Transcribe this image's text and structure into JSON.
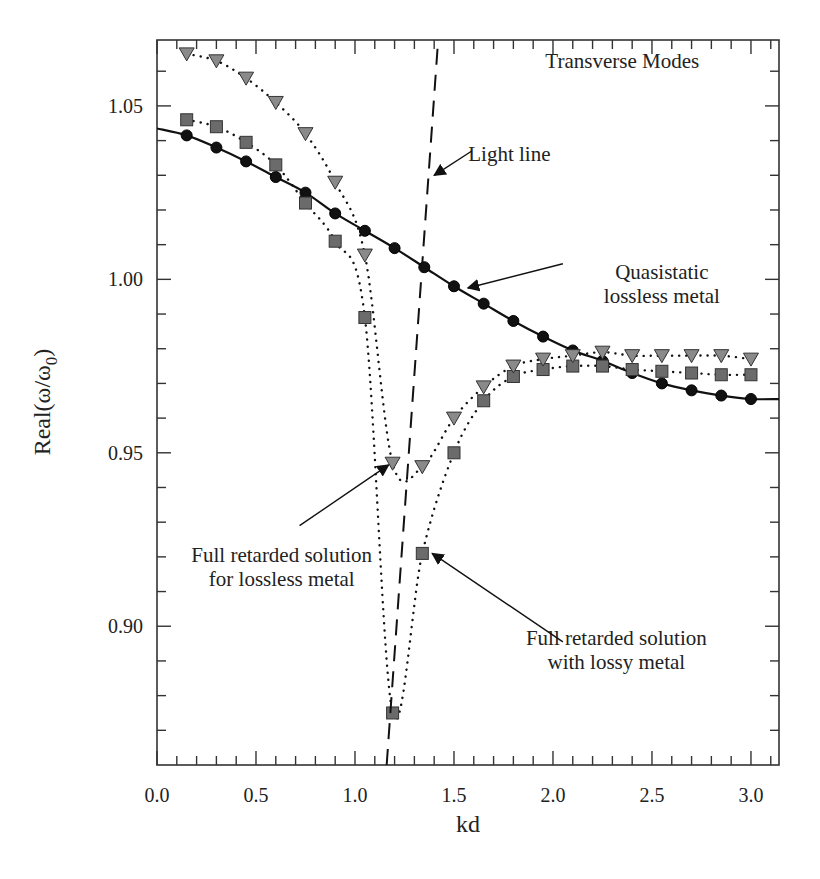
{
  "chart_data": {
    "type": "scatter",
    "title": "",
    "xlabel": "kd",
    "ylabel": "Real(ω/ω₀)",
    "ylabel_main": "Real(ω/ω",
    "ylabel_sub": "0",
    "ylabel_close": ")",
    "xlim": [
      0.0,
      3.1416
    ],
    "ylim": [
      0.86,
      1.069
    ],
    "x_ticks": [
      0.0,
      0.5,
      1.0,
      1.5,
      2.0,
      2.5,
      3.0
    ],
    "x_tick_labels": [
      "0.0",
      "0.5",
      "1.0",
      "1.5",
      "2.0",
      "2.5",
      "3.0"
    ],
    "x_minor_step": 0.1,
    "y_ticks": [
      0.9,
      0.95,
      1.0,
      1.05
    ],
    "y_tick_labels": [
      "0.90",
      "0.95",
      "1.00",
      "1.05"
    ],
    "y_minor_step": 0.01,
    "grid": false,
    "series": [
      {
        "name": "Quasistatic lossless metal",
        "marker": "circle",
        "line": "solid",
        "color": "#111111",
        "x": [
          0.15,
          0.3,
          0.45,
          0.6,
          0.75,
          0.9,
          1.05,
          1.2,
          1.35,
          1.5,
          1.65,
          1.8,
          1.95,
          2.1,
          2.25,
          2.4,
          2.55,
          2.7,
          2.85,
          3.0
        ],
        "y": [
          1.0415,
          1.038,
          1.034,
          1.0295,
          1.025,
          1.019,
          1.014,
          1.009,
          1.0035,
          0.998,
          0.993,
          0.988,
          0.9835,
          0.9795,
          0.9765,
          0.973,
          0.97,
          0.968,
          0.9665,
          0.9655
        ],
        "curve_start": [
          0.0,
          1.0435
        ],
        "curve_end": [
          3.1416,
          0.9655
        ]
      },
      {
        "name": "Full retarded solution with lossy metal",
        "marker": "square",
        "line": "dotted",
        "color": "#6b6b6b",
        "x": [
          0.15,
          0.3,
          0.45,
          0.6,
          0.75,
          0.9,
          1.05,
          1.19,
          1.34,
          1.5,
          1.65,
          1.8,
          1.95,
          2.1,
          2.25,
          2.4,
          2.55,
          2.7,
          2.85,
          3.0
        ],
        "y": [
          1.046,
          1.044,
          1.0395,
          1.033,
          1.022,
          1.011,
          0.989,
          0.875,
          0.921,
          0.95,
          0.965,
          0.972,
          0.974,
          0.975,
          0.975,
          0.974,
          0.9735,
          0.973,
          0.9725,
          0.9725
        ]
      },
      {
        "name": "Full retarded solution for lossless metal",
        "marker": "triangle-down",
        "line": "dotted",
        "color": "#8a8a8a",
        "x": [
          0.15,
          0.3,
          0.45,
          0.6,
          0.75,
          0.9,
          1.05,
          1.19,
          1.34,
          1.5,
          1.65,
          1.8,
          1.95,
          2.1,
          2.25,
          2.4,
          2.55,
          2.7,
          2.85,
          3.0
        ],
        "y": [
          1.065,
          1.063,
          1.058,
          1.051,
          1.042,
          1.028,
          1.007,
          0.947,
          0.946,
          0.96,
          0.969,
          0.975,
          0.977,
          0.978,
          0.979,
          0.978,
          0.978,
          0.978,
          0.978,
          0.977
        ]
      },
      {
        "name": "Light line",
        "marker": "none",
        "line": "dashed",
        "color": "#111111",
        "x": [
          1.16,
          1.42
        ],
        "y": [
          0.86,
          1.069
        ]
      }
    ],
    "annotations": [
      {
        "id": "transverse",
        "lines": [
          "Transverse Modes"
        ],
        "anchor_data": [
          2.35,
          1.061
        ],
        "arrow_to": null
      },
      {
        "id": "lightline",
        "lines": [
          "Light line"
        ],
        "anchor_data": [
          1.78,
          1.034
        ],
        "arrow_from": [
          1.59,
          1.037
        ],
        "arrow_to": [
          1.4,
          1.03
        ]
      },
      {
        "id": "quasistatic",
        "lines": [
          "Quasistatic",
          "lossless metal"
        ],
        "anchor_data": [
          2.55,
          1.0
        ],
        "arrow_from": [
          2.05,
          1.0045
        ],
        "arrow_to": [
          1.57,
          0.9975
        ]
      },
      {
        "id": "lossless",
        "lines": [
          "Full retarded solution",
          "for lossless metal"
        ],
        "anchor_data": [
          0.63,
          0.9185
        ],
        "arrow_from": [
          0.72,
          0.929
        ],
        "arrow_to": [
          1.17,
          0.9465
        ]
      },
      {
        "id": "lossy",
        "lines": [
          "Full retarded solution",
          "with lossy metal"
        ],
        "anchor_data": [
          2.32,
          0.8945
        ],
        "arrow_from": [
          2.05,
          0.8955
        ],
        "arrow_to": [
          1.39,
          0.921
        ]
      }
    ]
  }
}
